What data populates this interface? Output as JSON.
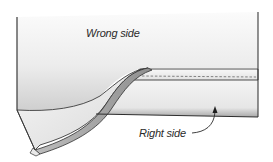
{
  "figure": {
    "labels": {
      "wrong_side": "Wrong side",
      "right_side": "Right side"
    },
    "colors": {
      "background": "#ffffff",
      "fabric_light": "#f2f2f2",
      "fabric_shade": "#d4d4d4",
      "fabric_dark": "#9a9a9a",
      "outline": "#3a3a3a",
      "stitch": "#555555"
    }
  }
}
